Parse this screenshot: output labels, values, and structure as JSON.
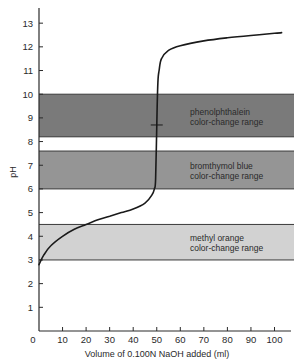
{
  "chart_data": {
    "type": "line",
    "title": "",
    "xlabel": "Volume of 0.100N NaOH added (ml)",
    "ylabel": "pH",
    "xlim": [
      0,
      105
    ],
    "ylim": [
      0,
      13.8
    ],
    "x_ticks": [
      0,
      10,
      20,
      30,
      40,
      50,
      60,
      70,
      80,
      90,
      100
    ],
    "y_ticks": [
      1,
      2,
      3,
      4,
      5,
      6,
      7,
      8,
      9,
      10,
      11,
      12,
      13
    ],
    "grid": false,
    "legend": null,
    "series": [
      {
        "name": "Titration curve",
        "x": [
          0,
          2,
          5,
          10,
          15,
          20,
          25,
          30,
          35,
          40,
          45,
          48,
          49,
          49.5,
          50,
          50.5,
          51,
          52,
          55,
          60,
          70,
          80,
          90,
          100,
          103
        ],
        "y": [
          2.8,
          3.2,
          3.6,
          4.0,
          4.3,
          4.5,
          4.7,
          4.85,
          5.0,
          5.15,
          5.4,
          5.75,
          6.0,
          6.4,
          8.7,
          10.5,
          11.0,
          11.5,
          11.85,
          12.05,
          12.25,
          12.38,
          12.48,
          12.57,
          12.6
        ]
      }
    ],
    "equivalence_point": {
      "x": 50,
      "y": 8.7
    },
    "bands": [
      {
        "name": "phenolphthalein",
        "label_line1": "phenolphthalein",
        "label_line2": "color-change range",
        "ph_low": 8.2,
        "ph_high": 10.0,
        "color": "#7a7a7a"
      },
      {
        "name": "bromthymol blue",
        "label_line1": "bromthymol blue",
        "label_line2": "color-change range",
        "ph_low": 6.0,
        "ph_high": 7.6,
        "color": "#959595"
      },
      {
        "name": "methyl orange",
        "label_line1": "methyl orange",
        "label_line2": "color-change range",
        "ph_low": 3.0,
        "ph_high": 4.5,
        "color": "#d2d2d2"
      }
    ]
  }
}
